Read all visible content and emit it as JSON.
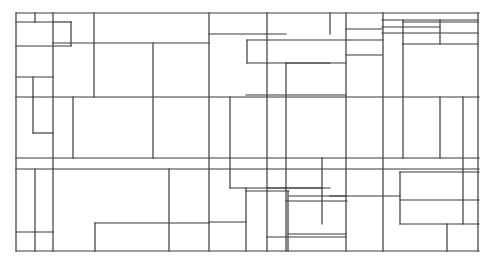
{
  "drawing": {
    "kind": "rectangular-partition-line-drawing",
    "stroke_color": "#3a3a3a",
    "background": "#ffffff",
    "frame": {
      "x1": 16,
      "y1": 13,
      "x2": 479,
      "y2": 251
    },
    "horizontal": [
      [
        16,
        13,
        479,
        13
      ],
      [
        16,
        22,
        53,
        22
      ],
      [
        16,
        46,
        71,
        46
      ],
      [
        53,
        22,
        71,
        22
      ],
      [
        53,
        43,
        209,
        43
      ],
      [
        209,
        34,
        286,
        34
      ],
      [
        247,
        40,
        383,
        40
      ],
      [
        247,
        63,
        330,
        63
      ],
      [
        286,
        63,
        346,
        63
      ],
      [
        346,
        55,
        382,
        55
      ],
      [
        382,
        20,
        478,
        20
      ],
      [
        403,
        22,
        478,
        22
      ],
      [
        382,
        27,
        440,
        27
      ],
      [
        382,
        33,
        478,
        33
      ],
      [
        403,
        44,
        478,
        44
      ],
      [
        346,
        29,
        382,
        29
      ],
      [
        16,
        77,
        53,
        77
      ],
      [
        16,
        97,
        479,
        97
      ],
      [
        246,
        95,
        346,
        95
      ],
      [
        33,
        133,
        53,
        133
      ],
      [
        16,
        158,
        479,
        158
      ],
      [
        16,
        169,
        479,
        169
      ],
      [
        230,
        188,
        322,
        188
      ],
      [
        267,
        188,
        330,
        188
      ],
      [
        330,
        196,
        400,
        196
      ],
      [
        400,
        172,
        479,
        172
      ],
      [
        400,
        200,
        479,
        200
      ],
      [
        400,
        224,
        479,
        224
      ],
      [
        286,
        201,
        347,
        201
      ],
      [
        246,
        191,
        289,
        191
      ],
      [
        289,
        196,
        346,
        196
      ],
      [
        95,
        223,
        209,
        223
      ],
      [
        209,
        222,
        246,
        222
      ],
      [
        16,
        232,
        53,
        232
      ],
      [
        16,
        251,
        479,
        251
      ],
      [
        267,
        237,
        346,
        237
      ],
      [
        288,
        234,
        346,
        234
      ]
    ],
    "vertical": [
      [
        16,
        13,
        16,
        251
      ],
      [
        35,
        13,
        35,
        22
      ],
      [
        53,
        13,
        53,
        251
      ],
      [
        71,
        22,
        71,
        46
      ],
      [
        33,
        77,
        33,
        97
      ],
      [
        33,
        97,
        33,
        133
      ],
      [
        73,
        97,
        73,
        158
      ],
      [
        94,
        13,
        94,
        97
      ],
      [
        153,
        43,
        153,
        158
      ],
      [
        209,
        13,
        209,
        251
      ],
      [
        230,
        97,
        230,
        188
      ],
      [
        247,
        40,
        247,
        63
      ],
      [
        267,
        13,
        267,
        251
      ],
      [
        286,
        63,
        286,
        251
      ],
      [
        330,
        13,
        330,
        34
      ],
      [
        346,
        13,
        346,
        251
      ],
      [
        383,
        13,
        383,
        251
      ],
      [
        403,
        20,
        403,
        44
      ],
      [
        403,
        44,
        403,
        158
      ],
      [
        440,
        20,
        440,
        44
      ],
      [
        463,
        97,
        463,
        224
      ],
      [
        440,
        97,
        440,
        158
      ],
      [
        478,
        13,
        478,
        251
      ],
      [
        35,
        169,
        35,
        251
      ],
      [
        95,
        223,
        95,
        251
      ],
      [
        169,
        169,
        169,
        251
      ],
      [
        322,
        158,
        322,
        224
      ],
      [
        246,
        188,
        246,
        251
      ],
      [
        288,
        191,
        288,
        251
      ],
      [
        400,
        172,
        400,
        224
      ],
      [
        447,
        224,
        447,
        251
      ]
    ]
  }
}
